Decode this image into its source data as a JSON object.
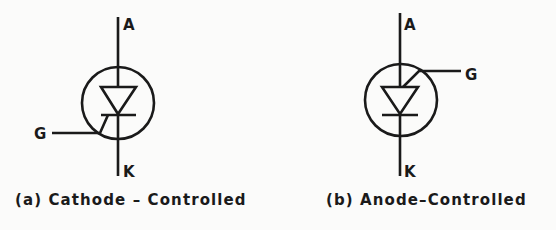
{
  "figure": {
    "panels": [
      {
        "id": "a",
        "caption": "(a) Cathode – Controlled",
        "terminals": {
          "anode": "A",
          "gate": "G",
          "cathode": "K"
        },
        "gate_position": "cathode-side, left"
      },
      {
        "id": "b",
        "caption": "(b) Anode–Controlled",
        "terminals": {
          "anode": "A",
          "gate": "G",
          "cathode": "K"
        },
        "gate_position": "anode-side, right"
      }
    ],
    "colors": {
      "ink": "#1a1a1a",
      "paper": "#fbfbfa"
    }
  }
}
